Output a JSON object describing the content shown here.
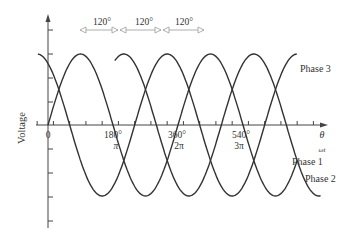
{
  "diagram": {
    "y_axis_label": "Voltage",
    "x_axis_label_theta": "θ",
    "x_axis_label_omega": "ωt",
    "origin_label": "0",
    "ticks": [
      {
        "deg": "180°",
        "rad": "π"
      },
      {
        "deg": "360°",
        "rad": "2π"
      },
      {
        "deg": "540°",
        "rad": "3π"
      }
    ],
    "phase_shift_labels": [
      "120°",
      "120°",
      "120°"
    ],
    "phases": [
      {
        "name": "Phase 1",
        "shift_deg": 0
      },
      {
        "name": "Phase 2",
        "shift_deg": 120
      },
      {
        "name": "Phase 3",
        "shift_deg": -120
      }
    ],
    "colors": {
      "curve": "#333333",
      "axis": "#444444",
      "arrow": "#9a9a9a"
    }
  }
}
